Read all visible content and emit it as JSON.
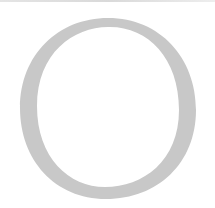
{
  "glyph": {
    "character": "O",
    "color": "#c8c8c8",
    "background": "#ffffff",
    "edge_color": "#d0d0d0"
  }
}
